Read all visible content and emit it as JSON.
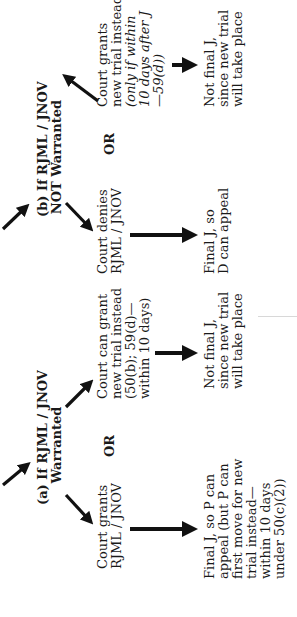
{
  "branch_a": {
    "heading_line1": "(a) If RJML / JNOV",
    "heading_line2": "Warranted",
    "or_label": "OR",
    "left_option": {
      "lines": [
        "Court grants",
        "RJML / JNOV"
      ]
    },
    "right_option": {
      "lines": [
        "Court can grant",
        "new trial instead",
        "(50(b); 59(d)—",
        "within 10 days)"
      ]
    },
    "left_result": {
      "lines": [
        "Final J, so P can",
        "appeal (but P can",
        "first move for new",
        "trial instead—",
        "within 10 days",
        "under 50(c)(2))"
      ]
    },
    "right_result": {
      "lines": [
        "Not final J,",
        "since new trial",
        "will take place"
      ]
    }
  },
  "branch_b": {
    "heading_line1": "(b) If RJML / JNOV",
    "heading_line2": "NOT Warranted",
    "or_label": "OR",
    "left_option": {
      "lines": [
        "Court denies",
        "RJML / JNOV"
      ]
    },
    "right_option": {
      "lines": [
        "Court grants",
        "new trial instead",
        "(only if within",
        "10 days after J",
        "—59(d))"
      ]
    },
    "left_result": {
      "lines": [
        "Final J, so",
        "D can appeal"
      ]
    },
    "right_result": {
      "lines": [
        "Not final J,",
        "since new trial",
        "will take place"
      ]
    }
  },
  "colors": {
    "text": "#1a1a1a",
    "arrow": "#111111",
    "background": "#ffffff"
  }
}
